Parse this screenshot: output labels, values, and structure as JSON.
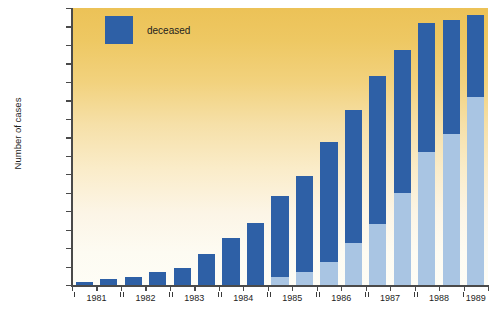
{
  "chart_data": {
    "type": "bar",
    "title": "",
    "subtitle": "",
    "xlabel": "",
    "ylabel": "Number of cases",
    "ylim": [
      0,
      15000
    ],
    "ytick_step": 1000,
    "grid": false,
    "stacked": true,
    "legend_position": "top-left",
    "legend": [
      {
        "name": "deceased",
        "color": "#2e60a6"
      }
    ],
    "series": [
      {
        "name": "deceased",
        "color": "#2e60a6",
        "values": [
          180,
          300,
          450,
          720,
          900,
          1680,
          2570,
          3380,
          4350,
          5200,
          6500,
          7200,
          8000,
          7700,
          7000,
          6150,
          4400
        ]
      },
      {
        "name": "living",
        "color": "#a9c5e3",
        "values": [
          0,
          0,
          0,
          0,
          0,
          0,
          0,
          0,
          450,
          700,
          1250,
          2300,
          3300,
          5000,
          7200,
          8200,
          10200
        ]
      }
    ],
    "totals": [
      180,
      300,
      450,
      720,
      900,
      1680,
      2570,
      3380,
      4800,
      5900,
      7750,
      9500,
      11300,
      12700,
      14200,
      14350,
      14600
    ],
    "x": [
      "1981-H1",
      "1981-H2",
      "1982-H1",
      "1982-H2",
      "1983-H1",
      "1983-H2",
      "1984-H1",
      "1984-H2",
      "1985-H1",
      "1985-H2",
      "1986-H1",
      "1986-H2",
      "1987-H1",
      "1987-H2",
      "1988-H1",
      "1988-H2",
      "1989-H1"
    ],
    "ytick_labels": [
      "0",
      "1,000",
      "2,000",
      "3,000",
      "4,000",
      "5,000",
      "6,000",
      "7,000",
      "8,000",
      "9,000",
      "10,000",
      "11,000",
      "12,000",
      "13,000",
      "14,000",
      "15,000"
    ],
    "year_groups": [
      {
        "label": "1981",
        "bars": 2,
        "bracket": true
      },
      {
        "label": "1982",
        "bars": 2,
        "bracket": true
      },
      {
        "label": "1983",
        "bars": 2,
        "bracket": true
      },
      {
        "label": "1984",
        "bars": 2,
        "bracket": true
      },
      {
        "label": "1985",
        "bars": 2,
        "bracket": true
      },
      {
        "label": "1986",
        "bars": 2,
        "bracket": true
      },
      {
        "label": "1987",
        "bars": 2,
        "bracket": true
      },
      {
        "label": "1988",
        "bars": 2,
        "bracket": true
      },
      {
        "label": "1989",
        "bars": 1,
        "bracket": false
      }
    ]
  },
  "colors": {
    "deceased": "#2e60a6",
    "living": "#a9c5e3",
    "background_top": "#ecc257",
    "background_bottom": "#fefdf6",
    "axis": "#4a4a4a",
    "text": "#1d1d1d"
  },
  "legend": {
    "deceased_label": "deceased"
  },
  "axis": {
    "y_title": "Number of cases"
  }
}
